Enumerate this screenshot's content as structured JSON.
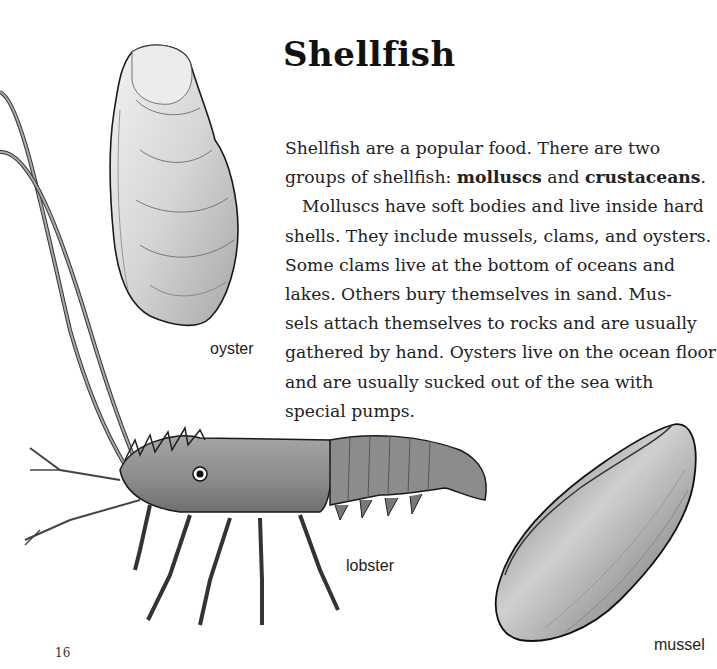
{
  "page": {
    "title": "Shellfish",
    "page_number": "16"
  },
  "paragraphs": {
    "p1": {
      "line1": "Shellfish are a popular food. There are two",
      "line2_pre": "groups of shellfish: ",
      "term1": "molluscs",
      "line2_mid": " and ",
      "term2": "crustaceans",
      "line2_post": "."
    },
    "p2": {
      "lines": [
        "Molluscs have soft bodies and live inside hard",
        "shells. They include mussels, clams, and oysters.",
        "Some clams live at the bottom of oceans and",
        "lakes. Others bury themselves in sand. Mus-",
        "sels attach themselves to rocks and are usually",
        "gathered by hand. Oysters live on the ocean floor",
        "and are usually sucked out of the sea with",
        "special pumps."
      ]
    }
  },
  "illustrations": {
    "oyster": {
      "label": "oyster",
      "icon": "oyster-illustration"
    },
    "lobster": {
      "label": "lobster",
      "icon": "lobster-illustration"
    },
    "mussel": {
      "label": "mussel",
      "icon": "mussel-illustration"
    }
  },
  "colors": {
    "background": "#ffffff",
    "text": "#222222",
    "outline": "#1a1a1a",
    "shell_fill": "#d8d8d8",
    "shell_shadow": "#9a9a9a"
  }
}
